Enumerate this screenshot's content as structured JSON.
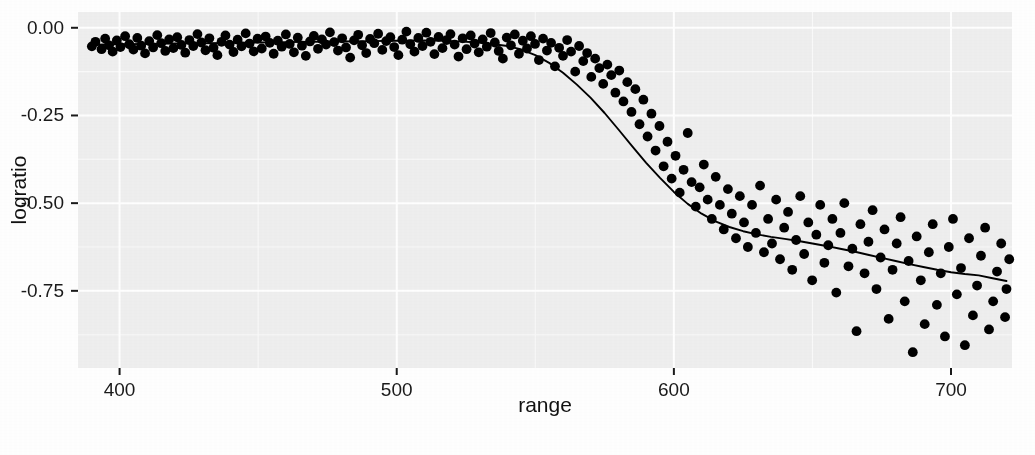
{
  "chart_data": {
    "type": "scatter",
    "title": "",
    "subtitle": "",
    "xlabel": "range",
    "ylabel": "logratio",
    "xlim": [
      385,
      722
    ],
    "ylim": [
      -0.97,
      0.045
    ],
    "xticks": [
      400,
      500,
      600,
      700
    ],
    "xtick_labels": [
      "400",
      "500",
      "600",
      "700"
    ],
    "yticks": [
      0.0,
      -0.25,
      -0.5,
      -0.75
    ],
    "ytick_labels": [
      "0.00",
      "-0.25",
      "-0.50",
      "-0.75"
    ],
    "grid": true,
    "grid_major_color": "#ffffff",
    "grid_minor_color": "#fafafa",
    "panel_background": "#efefef",
    "point_color": "#000000",
    "point_size": 5.6,
    "line_color": "#000000",
    "line_width": 1.9,
    "legend_position": "none",
    "series": [
      {
        "name": "observations",
        "type": "scatter",
        "x": [
          390.0,
          391.3,
          393.5,
          394.8,
          396.2,
          397.5,
          399.0,
          400.3,
          402.0,
          403.5,
          405.0,
          406.4,
          407.8,
          409.2,
          410.7,
          412.1,
          413.6,
          415.0,
          416.5,
          417.9,
          419.4,
          420.8,
          422.3,
          423.7,
          425.2,
          426.6,
          428.1,
          429.5,
          431.0,
          432.4,
          433.9,
          435.3,
          436.8,
          438.2,
          439.7,
          441.1,
          442.6,
          444.0,
          445.5,
          446.9,
          448.4,
          449.8,
          451.3,
          452.7,
          454.2,
          455.6,
          457.1,
          458.5,
          460.0,
          461.4,
          462.9,
          464.3,
          465.8,
          467.2,
          468.7,
          470.1,
          471.6,
          473.0,
          474.5,
          475.9,
          477.4,
          478.8,
          480.3,
          481.7,
          483.2,
          484.6,
          486.1,
          487.5,
          489.0,
          490.4,
          491.9,
          493.3,
          494.8,
          496.2,
          497.7,
          499.1,
          500.6,
          502.0,
          503.5,
          504.9,
          506.4,
          507.8,
          509.3,
          510.7,
          512.2,
          513.6,
          515.1,
          516.5,
          518.0,
          519.4,
          520.9,
          522.3,
          523.8,
          525.2,
          526.7,
          528.1,
          529.6,
          531.0,
          532.5,
          533.9,
          535.4,
          536.8,
          538.3,
          539.7,
          541.2,
          542.6,
          544.1,
          545.5,
          547.0,
          548.4,
          549.9,
          551.3,
          552.8,
          554.2,
          555.7,
          557.1,
          558.6,
          560.0,
          561.5,
          562.9,
          564.4,
          565.8,
          567.3,
          568.7,
          570.2,
          571.6,
          573.1,
          574.5,
          576.0,
          577.4,
          578.9,
          580.3,
          581.8,
          583.2,
          584.7,
          586.1,
          587.6,
          589.0,
          590.5,
          591.9,
          593.4,
          594.8,
          596.3,
          597.7,
          599.2,
          600.6,
          602.1,
          603.5,
          605.0,
          606.4,
          607.9,
          609.3,
          610.8,
          612.2,
          613.7,
          615.1,
          616.6,
          618.0,
          619.5,
          620.9,
          622.4,
          623.8,
          625.3,
          626.7,
          628.2,
          629.6,
          631.1,
          632.5,
          634.0,
          635.4,
          636.9,
          638.3,
          639.8,
          641.2,
          642.7,
          644.1,
          645.6,
          647.0,
          648.5,
          649.9,
          651.4,
          652.8,
          654.3,
          655.7,
          657.2,
          658.6,
          660.1,
          661.5,
          663.0,
          664.4,
          665.9,
          667.3,
          668.8,
          670.2,
          671.7,
          673.1,
          674.6,
          676.0,
          677.5,
          678.9,
          680.4,
          681.8,
          683.3,
          684.7,
          686.2,
          687.6,
          689.1,
          690.5,
          692.0,
          693.4,
          694.9,
          696.3,
          697.8,
          699.2,
          700.7,
          702.1,
          703.6,
          705.0,
          706.5,
          707.9,
          709.4,
          710.8,
          712.3,
          713.7,
          715.2,
          716.6,
          718.1,
          719.5,
          720.0,
          721.0
        ],
        "y": [
          -0.053,
          -0.04,
          -0.061,
          -0.031,
          -0.05,
          -0.068,
          -0.036,
          -0.055,
          -0.024,
          -0.047,
          -0.062,
          -0.029,
          -0.051,
          -0.073,
          -0.038,
          -0.056,
          -0.021,
          -0.044,
          -0.066,
          -0.033,
          -0.058,
          -0.027,
          -0.049,
          -0.071,
          -0.035,
          -0.052,
          -0.018,
          -0.042,
          -0.064,
          -0.03,
          -0.057,
          -0.078,
          -0.04,
          -0.022,
          -0.048,
          -0.069,
          -0.034,
          -0.053,
          -0.016,
          -0.045,
          -0.067,
          -0.031,
          -0.059,
          -0.025,
          -0.043,
          -0.074,
          -0.037,
          -0.054,
          -0.019,
          -0.046,
          -0.07,
          -0.028,
          -0.051,
          -0.08,
          -0.039,
          -0.023,
          -0.06,
          -0.033,
          -0.048,
          -0.013,
          -0.041,
          -0.065,
          -0.03,
          -0.056,
          -0.085,
          -0.036,
          -0.02,
          -0.05,
          -0.072,
          -0.032,
          -0.044,
          -0.017,
          -0.063,
          -0.038,
          -0.027,
          -0.055,
          -0.078,
          -0.034,
          -0.011,
          -0.047,
          -0.068,
          -0.029,
          -0.052,
          -0.014,
          -0.04,
          -0.075,
          -0.026,
          -0.058,
          -0.035,
          -0.018,
          -0.048,
          -0.082,
          -0.03,
          -0.061,
          -0.022,
          -0.045,
          -0.07,
          -0.033,
          -0.054,
          -0.015,
          -0.042,
          -0.066,
          -0.088,
          -0.028,
          -0.05,
          -0.019,
          -0.074,
          -0.037,
          -0.059,
          -0.024,
          -0.046,
          -0.092,
          -0.031,
          -0.065,
          -0.043,
          -0.11,
          -0.057,
          -0.08,
          -0.035,
          -0.068,
          -0.125,
          -0.052,
          -0.095,
          -0.072,
          -0.14,
          -0.088,
          -0.115,
          -0.16,
          -0.105,
          -0.135,
          -0.185,
          -0.122,
          -0.21,
          -0.155,
          -0.24,
          -0.175,
          -0.275,
          -0.205,
          -0.31,
          -0.245,
          -0.35,
          -0.28,
          -0.395,
          -0.325,
          -0.43,
          -0.365,
          -0.47,
          -0.405,
          -0.3,
          -0.44,
          -0.51,
          -0.455,
          -0.39,
          -0.49,
          -0.545,
          -0.425,
          -0.505,
          -0.575,
          -0.46,
          -0.53,
          -0.6,
          -0.48,
          -0.555,
          -0.625,
          -0.505,
          -0.585,
          -0.45,
          -0.64,
          -0.545,
          -0.615,
          -0.49,
          -0.66,
          -0.57,
          -0.525,
          -0.69,
          -0.605,
          -0.48,
          -0.645,
          -0.555,
          -0.72,
          -0.59,
          -0.505,
          -0.67,
          -0.62,
          -0.545,
          -0.755,
          -0.585,
          -0.5,
          -0.68,
          -0.63,
          -0.865,
          -0.56,
          -0.7,
          -0.61,
          -0.52,
          -0.745,
          -0.655,
          -0.575,
          -0.83,
          -0.69,
          -0.615,
          -0.54,
          -0.78,
          -0.665,
          -0.925,
          -0.595,
          -0.72,
          -0.845,
          -0.64,
          -0.56,
          -0.79,
          -0.7,
          -0.88,
          -0.625,
          -0.545,
          -0.76,
          -0.685,
          -0.905,
          -0.6,
          -0.82,
          -0.735,
          -0.65,
          -0.57,
          -0.86,
          -0.78,
          -0.695,
          -0.615,
          -0.825,
          -0.745,
          -0.66
        ]
      },
      {
        "name": "smoothed-fit",
        "type": "line",
        "x": [
          390,
          400,
          410,
          420,
          430,
          440,
          450,
          460,
          470,
          480,
          490,
          500,
          510,
          520,
          530,
          540,
          545,
          550,
          555,
          560,
          565,
          570,
          575,
          580,
          585,
          590,
          595,
          600,
          605,
          610,
          615,
          620,
          625,
          630,
          635,
          640,
          645,
          650,
          655,
          660,
          665,
          670,
          675,
          680,
          685,
          690,
          695,
          700,
          705,
          710,
          715,
          720
        ],
        "y": [
          -0.048,
          -0.047,
          -0.046,
          -0.045,
          -0.044,
          -0.043,
          -0.042,
          -0.041,
          -0.04,
          -0.039,
          -0.038,
          -0.037,
          -0.036,
          -0.038,
          -0.042,
          -0.052,
          -0.062,
          -0.078,
          -0.1,
          -0.128,
          -0.162,
          -0.2,
          -0.243,
          -0.29,
          -0.338,
          -0.385,
          -0.428,
          -0.468,
          -0.502,
          -0.53,
          -0.552,
          -0.568,
          -0.58,
          -0.589,
          -0.596,
          -0.602,
          -0.608,
          -0.615,
          -0.622,
          -0.63,
          -0.638,
          -0.647,
          -0.656,
          -0.665,
          -0.674,
          -0.682,
          -0.69,
          -0.697,
          -0.702,
          -0.706,
          -0.714,
          -0.722
        ]
      }
    ]
  },
  "axes": {
    "x_title": "range",
    "y_title": "logratio"
  }
}
